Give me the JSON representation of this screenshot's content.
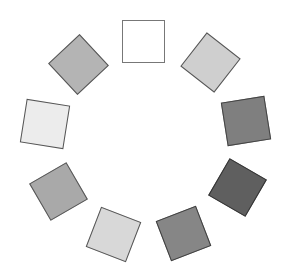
{
  "figure": {
    "squares": [
      {
        "name": "top",
        "cx": 143,
        "cy": 41,
        "size": 43,
        "rotation": 0,
        "fill": "#ffffff",
        "border": "#777777"
      },
      {
        "name": "top-right",
        "cx": 210,
        "cy": 62,
        "size": 43,
        "rotation": 38,
        "fill": "#cfcfcf",
        "border": "#555555"
      },
      {
        "name": "right",
        "cx": 246,
        "cy": 121,
        "size": 44,
        "rotation": -9,
        "fill": "#7f7f7f",
        "border": "#444444"
      },
      {
        "name": "bottom-right",
        "cx": 237,
        "cy": 187,
        "size": 43,
        "rotation": 30,
        "fill": "#5f5f5f",
        "border": "#333333"
      },
      {
        "name": "bottom-right-lower",
        "cx": 183,
        "cy": 233,
        "size": 43,
        "rotation": -21,
        "fill": "#868686",
        "border": "#3f3f3f"
      },
      {
        "name": "bottom",
        "cx": 113,
        "cy": 234,
        "size": 43,
        "rotation": 21,
        "fill": "#d8d8d8",
        "border": "#555555"
      },
      {
        "name": "bottom-left",
        "cx": 58,
        "cy": 191,
        "size": 43,
        "rotation": -30,
        "fill": "#a9a9a9",
        "border": "#555555"
      },
      {
        "name": "left",
        "cx": 45,
        "cy": 124,
        "size": 44,
        "rotation": 9,
        "fill": "#ececec",
        "border": "#555555"
      },
      {
        "name": "top-left",
        "cx": 78,
        "cy": 64,
        "size": 43,
        "rotation": 47,
        "fill": "#b4b4b4",
        "border": "#555555"
      }
    ]
  }
}
